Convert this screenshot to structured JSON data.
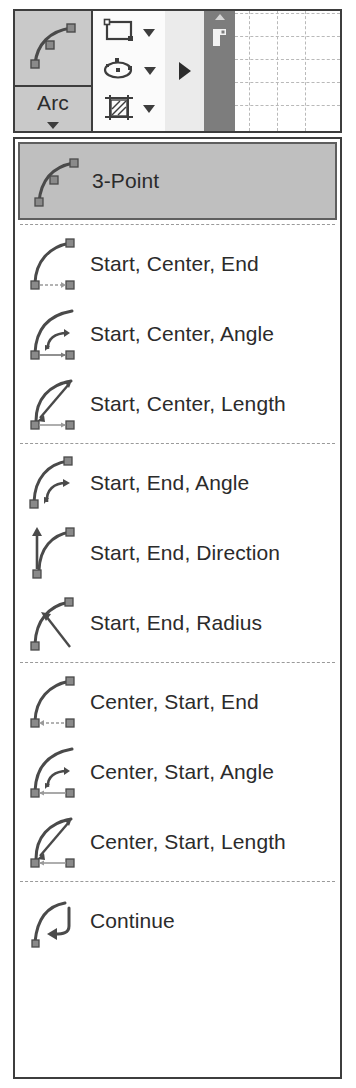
{
  "ribbon": {
    "arc_button": {
      "label": "Arc",
      "icon": "arc-3point-icon",
      "dropdown_caret": "chevron-down-icon"
    },
    "tool_icons": [
      {
        "icon": "rectangle-icon",
        "caret": "chevron-down-icon"
      },
      {
        "icon": "ellipse-icon",
        "caret": "chevron-down-icon"
      },
      {
        "icon": "hatch-icon",
        "caret": "chevron-down-icon"
      }
    ],
    "expand_arrow": "expand-right-arrow-icon",
    "strip": {
      "top_marker": "triangle-up-icon",
      "glyph": "corner-marker-icon"
    },
    "grid": {
      "columns": 4,
      "rows": 5
    }
  },
  "menu": {
    "groups": [
      {
        "items": [
          {
            "label": "3-Point",
            "icon": "arc-3point-icon",
            "selected": true
          }
        ]
      },
      {
        "items": [
          {
            "label": "Start, Center, End",
            "icon": "arc-start-center-end-icon",
            "selected": false
          },
          {
            "label": "Start, Center, Angle",
            "icon": "arc-start-center-angle-icon",
            "selected": false
          },
          {
            "label": "Start, Center, Length",
            "icon": "arc-start-center-length-icon",
            "selected": false
          }
        ]
      },
      {
        "items": [
          {
            "label": "Start, End, Angle",
            "icon": "arc-start-end-angle-icon",
            "selected": false
          },
          {
            "label": "Start, End, Direction",
            "icon": "arc-start-end-direction-icon",
            "selected": false
          },
          {
            "label": "Start, End, Radius",
            "icon": "arc-start-end-radius-icon",
            "selected": false
          }
        ]
      },
      {
        "items": [
          {
            "label": "Center, Start, End",
            "icon": "arc-center-start-end-icon",
            "selected": false
          },
          {
            "label": "Center, Start, Angle",
            "icon": "arc-center-start-angle-icon",
            "selected": false
          },
          {
            "label": "Center, Start, Length",
            "icon": "arc-center-start-length-icon",
            "selected": false
          }
        ]
      },
      {
        "items": [
          {
            "label": "Continue",
            "icon": "arc-continue-icon",
            "selected": false
          }
        ]
      }
    ]
  },
  "colors": {
    "border": "#3d3d3d",
    "selected_bg": "#bfbfbf",
    "button_bg": "#c9c9c9",
    "strip_bg": "#7d7d7d",
    "icon_stroke": "#4a4a4a",
    "text": "#2b2b2b"
  }
}
